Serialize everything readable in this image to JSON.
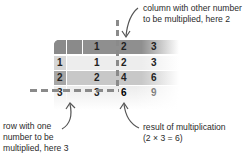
{
  "diagram": {
    "table": {
      "header_row": [
        "",
        "1",
        "2",
        "3"
      ],
      "rows": [
        {
          "row_label": "1",
          "values": [
            "1",
            "2",
            "3"
          ]
        },
        {
          "row_label": "2",
          "values": [
            "2",
            "4",
            "6"
          ]
        },
        {
          "row_label": "3",
          "values": [
            "3",
            "6",
            "9"
          ]
        }
      ],
      "highlight_result": "6"
    },
    "annotations": {
      "column": {
        "line1": "column with other number",
        "line2": "to be multiplied, here 2"
      },
      "row": {
        "line1": "row with one",
        "line2": "number to be",
        "line3": "multiplied, here 3"
      },
      "result": {
        "line1": "result of multiplication",
        "line2": "(2 × 3 = 6)"
      }
    },
    "colors": {
      "header": "#8f8f8f",
      "row_light": "#ededed",
      "row_mid": "#c8c8c8",
      "dash": "#8a8a8a",
      "arrow": "#555555"
    }
  }
}
